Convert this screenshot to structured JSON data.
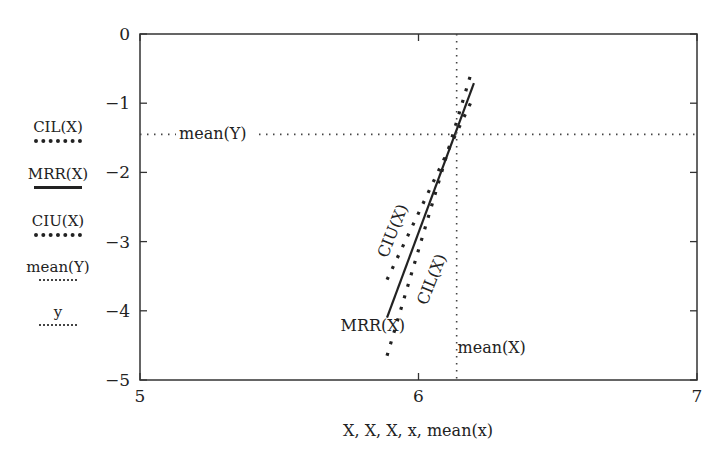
{
  "chart_data": {
    "type": "line",
    "title": "",
    "xlabel": "X, X, X, x, mean(x)",
    "ylabel": "",
    "xlim": [
      5,
      7
    ],
    "ylim": [
      -5,
      0
    ],
    "xticks": [
      5,
      6,
      7
    ],
    "yticks": [
      0,
      -1,
      -2,
      -3,
      -4,
      -5
    ],
    "xtick_labels": [
      "5",
      "6",
      "7"
    ],
    "ytick_labels": [
      "0",
      "−1",
      "−2",
      "−3",
      "−4",
      "−5"
    ],
    "grid": false,
    "legend_position": "left-outside",
    "series": [
      {
        "name": "CIL(X)",
        "style": "dashed",
        "x": [
          5.887,
          6.19
        ],
        "y": [
          -4.65,
          -0.55
        ]
      },
      {
        "name": "MRR(X)",
        "style": "solid",
        "x": [
          5.887,
          6.199
        ],
        "y": [
          -4.1,
          -0.71
        ]
      },
      {
        "name": "CIU(X)",
        "style": "dashed",
        "x": [
          5.887,
          6.195
        ],
        "y": [
          -3.55,
          -0.93
        ]
      },
      {
        "name": "mean(Y)",
        "style": "dotted",
        "x": [
          5,
          7
        ],
        "y": [
          -1.45,
          -1.45
        ]
      },
      {
        "name": "y",
        "style": "dotted",
        "x": [
          6.137,
          6.137
        ],
        "y": [
          0,
          -5
        ]
      }
    ],
    "annotations": [
      {
        "text": "mean(Y)",
        "x": 5.14,
        "y": -1.45
      },
      {
        "text": "CIU(X)",
        "x": 5.91,
        "y": -2.85,
        "rotation": -68
      },
      {
        "text": "CIL(X)",
        "x": 6.05,
        "y": -3.55,
        "rotation": -68
      },
      {
        "text": "MRR(X)",
        "x": 5.72,
        "y": -4.22
      },
      {
        "text": "mean(X)",
        "x": 6.14,
        "y": -4.55
      }
    ]
  },
  "legend": [
    {
      "label": "CIL(X)",
      "style": "dashed"
    },
    {
      "label": "MRR(X)",
      "style": "solid"
    },
    {
      "label": "CIU(X)",
      "style": "dashed"
    },
    {
      "label": "mean(Y)",
      "style": "dotted"
    },
    {
      "label": "y",
      "style": "dotted"
    }
  ],
  "colors": {
    "line": "#222222",
    "axis": "#333333",
    "background": "#ffffff"
  }
}
